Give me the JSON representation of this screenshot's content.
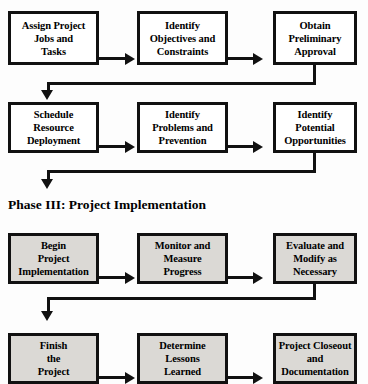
{
  "diagram": {
    "colors": {
      "background": "#fdfdfd",
      "box_border": "#111111",
      "box_fill_plain": "#ffffff",
      "box_fill_shaded": "#dbd9d5",
      "text": "#000000",
      "connector": "#111111"
    },
    "headings": [
      {
        "id": "phase-3",
        "text": "Phase III: Project Implementation"
      }
    ],
    "rows": [
      {
        "id": "row-1",
        "shaded": false,
        "boxes": [
          {
            "id": "assign-project-jobs-and-tasks",
            "text": "Assign Project\nJobs and\nTasks"
          },
          {
            "id": "identify-objectives-and-constraints",
            "text": "Identify\nObjectives and\nConstraints"
          },
          {
            "id": "obtain-preliminary-approval",
            "text": "Obtain\nPreliminary\nApproval"
          }
        ]
      },
      {
        "id": "row-2",
        "shaded": false,
        "boxes": [
          {
            "id": "schedule-resource-deployment",
            "text": "Schedule\nResource\nDeployment"
          },
          {
            "id": "identify-problems-and-prevention",
            "text": "Identify\nProblems and\nPrevention"
          },
          {
            "id": "identify-potential-opportunities",
            "text": "Identify\nPotential\nOpportunities"
          }
        ]
      },
      {
        "id": "row-3",
        "shaded": true,
        "boxes": [
          {
            "id": "begin-project-implementation",
            "text": "Begin\nProject\nImplementation"
          },
          {
            "id": "monitor-and-measure-progress",
            "text": "Monitor and\nMeasure\nProgress"
          },
          {
            "id": "evaluate-and-modify-as-necessary",
            "text": "Evaluate and\nModify as\nNecessary"
          }
        ]
      },
      {
        "id": "row-4",
        "shaded": true,
        "boxes": [
          {
            "id": "finish-the-project",
            "text": "Finish\nthe\nProject"
          },
          {
            "id": "determine-lessons-learned",
            "text": "Determine\nLessons\nLearned"
          },
          {
            "id": "project-closeout-and-documentation",
            "text": "Project Closeout\nand\nDocumentation"
          }
        ]
      }
    ]
  }
}
